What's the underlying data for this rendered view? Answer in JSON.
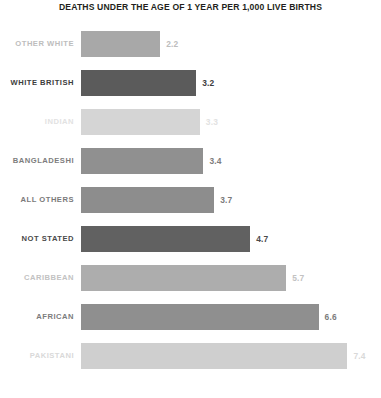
{
  "chart_data": {
    "type": "bar",
    "orientation": "horizontal",
    "title": "DEATHS UNDER THE AGE OF 1 YEAR PER 1,000 LIVE BIRTHS",
    "subtitle": "",
    "xlabel": "",
    "ylabel": "",
    "grid": false,
    "legend": "none",
    "xlim": [
      0,
      7.4
    ],
    "categories": [
      "OTHER WHITE",
      "WHITE BRITISH",
      "INDIAN",
      "BANGLADESHI",
      "ALL OTHERS",
      "NOT STATED",
      "CARIBBEAN",
      "AFRICAN",
      "PAKISTANI"
    ],
    "values": [
      2.2,
      3.2,
      3.3,
      3.4,
      3.7,
      4.7,
      5.7,
      6.6,
      7.4
    ],
    "value_labels": [
      "2.2",
      "3.2",
      "3.3",
      "3.4",
      "3.7",
      "4.7",
      "5.7",
      "6.6",
      "7.4"
    ],
    "bar_colors": [
      "#a8a8a8",
      "#5b5b5b",
      "#d5d5d5",
      "#909090",
      "#8d8d8d",
      "#616161",
      "#adadad",
      "#8f8f8f",
      "#cfcfcf"
    ],
    "label_colors": [
      "#bdbdbd",
      "#3d3d3d",
      "#e2e2e2",
      "#7d7d7d",
      "#7a7a7a",
      "#4a4a4a",
      "#c2c2c2",
      "#7c7c7c",
      "#d9d9d9"
    ],
    "title_color": "#231f20"
  }
}
